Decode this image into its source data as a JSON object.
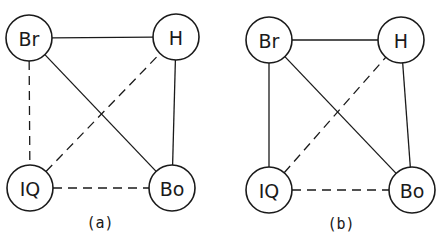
{
  "diagrams": [
    {
      "caption": "(a)",
      "caption_pos": [
        100,
        223
      ],
      "node_radius": 23,
      "nodes": {
        "Br": {
          "label": "Br",
          "x": 29,
          "y": 38
        },
        "H": {
          "label": "H",
          "x": 176,
          "y": 37
        },
        "IQ": {
          "label": "IQ",
          "x": 30,
          "y": 188
        },
        "Bo": {
          "label": "Bo",
          "x": 172,
          "y": 188
        }
      },
      "edges": [
        {
          "from": "Br",
          "to": "H",
          "style": "solid"
        },
        {
          "from": "Br",
          "to": "Bo",
          "style": "solid"
        },
        {
          "from": "H",
          "to": "Bo",
          "style": "solid"
        },
        {
          "from": "Br",
          "to": "IQ",
          "style": "dashed"
        },
        {
          "from": "IQ",
          "to": "H",
          "style": "dashed"
        },
        {
          "from": "IQ",
          "to": "Bo",
          "style": "dashed"
        }
      ]
    },
    {
      "caption": "(b)",
      "caption_pos": [
        341,
        224
      ],
      "node_radius": 23,
      "nodes": {
        "Br": {
          "label": "Br",
          "x": 269,
          "y": 40
        },
        "H": {
          "label": "H",
          "x": 401,
          "y": 40
        },
        "IQ": {
          "label": "IQ",
          "x": 269,
          "y": 190
        },
        "Bo": {
          "label": "Bo",
          "x": 412,
          "y": 190
        }
      },
      "edges": [
        {
          "from": "Br",
          "to": "H",
          "style": "solid"
        },
        {
          "from": "Br",
          "to": "Bo",
          "style": "solid"
        },
        {
          "from": "H",
          "to": "Bo",
          "style": "solid"
        },
        {
          "from": "Br",
          "to": "IQ",
          "style": "solid"
        },
        {
          "from": "IQ",
          "to": "H",
          "style": "dashed"
        },
        {
          "from": "IQ",
          "to": "Bo",
          "style": "dashed"
        }
      ]
    }
  ]
}
